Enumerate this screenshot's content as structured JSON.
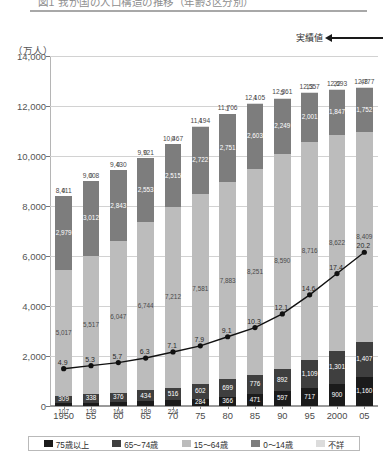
{
  "title": "図1 我が国の人口構造の推移（年齢3区分別）",
  "unit_label": "（万人）",
  "annotation": {
    "actual_values": "実績値",
    "arrow": "left-arrow-icon"
  },
  "legend": [
    {
      "label": "75歳以上",
      "color": "#1b1b1b",
      "key": "p75"
    },
    {
      "label": "65～74歳",
      "color": "#3f3f3f",
      "key": "p6574"
    },
    {
      "label": "15～64歳",
      "color": "#bcbcbc",
      "key": "p1564"
    },
    {
      "label": "0～14歳",
      "color": "#7d7d7d",
      "key": "p014"
    },
    {
      "label": "不詳",
      "color": "#dcdcdc",
      "key": "unknown"
    }
  ],
  "chart_data": {
    "type": "bar",
    "stacked": true,
    "title": "図1 我が国の人口構造の推移（年齢3区分別）",
    "xlabel": "",
    "ylabel": "（万人）",
    "ylim": [
      0,
      14000
    ],
    "ytick_labels": [
      "14,000",
      "12,000",
      "10,000",
      "8,000",
      "6,000",
      "4,000",
      "2,000",
      "0"
    ],
    "ytick_values": [
      14000,
      12000,
      10000,
      8000,
      6000,
      4000,
      2000,
      0
    ],
    "grid": true,
    "legend_position": "bottom",
    "categories": [
      "1950",
      "55",
      "60",
      "65",
      "70",
      "75",
      "80",
      "85",
      "90",
      "95",
      "2000",
      "05"
    ],
    "series": [
      {
        "name": "75歳以上",
        "key": "p75",
        "color": "#1b1b1b",
        "values": [
          107,
          139,
          164,
          189,
          224,
          284,
          366,
          471,
          597,
          717,
          900,
          1160
        ],
        "labels": [
          "107",
          "139",
          "164",
          "189",
          "224",
          "284",
          "366",
          "471",
          "597",
          "717",
          "900",
          "1,160"
        ]
      },
      {
        "name": "65～74歳",
        "key": "p6574",
        "color": "#3f3f3f",
        "values": [
          309,
          338,
          376,
          434,
          516,
          602,
          699,
          776,
          892,
          1109,
          1301,
          1407
        ],
        "labels": [
          "309",
          "338",
          "376",
          "434",
          "516",
          "602",
          "699",
          "776",
          "892",
          "1,109",
          "1,301",
          "1,407"
        ]
      },
      {
        "name": "15～64歳",
        "key": "p1564",
        "color": "#bcbcbc",
        "values": [
          5017,
          5517,
          6047,
          6744,
          7212,
          7581,
          7883,
          8251,
          8590,
          8716,
          8622,
          8409
        ],
        "labels": [
          "5,017",
          "5,517",
          "6,047",
          "6,744",
          "7,212",
          "7,581",
          "7,883",
          "8,251",
          "8,590",
          "8,716",
          "8,622",
          "8,409"
        ]
      },
      {
        "name": "0～14歳",
        "key": "p014",
        "color": "#7d7d7d",
        "values": [
          2979,
          3012,
          2843,
          2553,
          2515,
          2722,
          2751,
          2603,
          2249,
          2001,
          1847,
          1752
        ],
        "labels": [
          "2,979",
          "3,012",
          "2,843",
          "2,553",
          "2,515",
          "2,722",
          "2,751",
          "2,603",
          "2,249",
          "2,001",
          "1,847",
          "1,752"
        ]
      },
      {
        "name": "不詳",
        "key": "unknown",
        "color": "#dcdcdc",
        "values": [
          0,
          0,
          0,
          0,
          0,
          4,
          1,
          4,
          5,
          13,
          22,
          48
        ],
        "labels": [
          "0",
          "0",
          "0",
          "0",
          "0",
          "4",
          "1",
          "4",
          "5",
          "13",
          "22",
          "48"
        ]
      }
    ],
    "totals": [
      8411,
      9008,
      9430,
      9921,
      10467,
      11194,
      11706,
      12105,
      12361,
      12557,
      12693,
      12777
    ],
    "total_labels": [
      "8,411",
      "9,008",
      "9,430",
      "9,921",
      "10,467",
      "11,194",
      "11,706",
      "12,105",
      "12,361",
      "12,557",
      "12,693",
      "12,777"
    ],
    "line_series": {
      "name": "高齢化率",
      "type": "line",
      "marker": "circle",
      "color": "#111111",
      "values": [
        4.9,
        5.3,
        5.7,
        6.3,
        7.1,
        7.9,
        9.1,
        10.3,
        12.1,
        14.6,
        17.4,
        20.2
      ],
      "labels": [
        "4.9",
        "5.3",
        "5.7",
        "6.3",
        "7.1",
        "7.9",
        "9.1",
        "10.3",
        "12.1",
        "14.6",
        "17.4",
        "20.2"
      ]
    }
  }
}
